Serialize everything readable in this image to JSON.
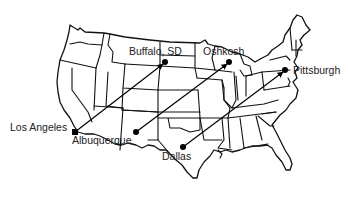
{
  "map": {
    "title": "",
    "region": "Contiguous United States",
    "style": {
      "line_color": "#111111",
      "background": "#ffffff",
      "label_color": "#222222"
    },
    "cities": [
      {
        "id": "los-angeles",
        "label": "Los Angeles",
        "x": 75,
        "y": 132,
        "lx": 10,
        "ly": 131,
        "dot": "square"
      },
      {
        "id": "buffalo-sd",
        "label": "Buffalo, SD",
        "x": 165,
        "y": 62,
        "lx": 129,
        "ly": 55,
        "dot": "circle"
      },
      {
        "id": "albuquerque",
        "label": "Albuquerque",
        "x": 136,
        "y": 132,
        "lx": 72,
        "ly": 144,
        "dot": "circle"
      },
      {
        "id": "oshkosh",
        "label": "Oshkosh",
        "x": 229,
        "y": 62,
        "lx": 203,
        "ly": 55,
        "dot": "circle"
      },
      {
        "id": "dallas",
        "label": "Dallas",
        "x": 183,
        "y": 147,
        "lx": 162,
        "ly": 160,
        "dot": "circle"
      },
      {
        "id": "pittsburgh",
        "label": "Pittsburgh",
        "x": 285,
        "y": 70,
        "lx": 293,
        "ly": 74,
        "dot": "circle"
      }
    ],
    "routes": [
      {
        "from": "Los Angeles",
        "to": "Buffalo, SD",
        "x1": 75,
        "y1": 132,
        "x2": 165,
        "y2": 62
      },
      {
        "from": "Albuquerque",
        "to": "Oshkosh",
        "x1": 136,
        "y1": 132,
        "x2": 229,
        "y2": 62
      },
      {
        "from": "Dallas",
        "to": "Pittsburgh",
        "x1": 183,
        "y1": 147,
        "x2": 285,
        "y2": 70
      }
    ]
  }
}
